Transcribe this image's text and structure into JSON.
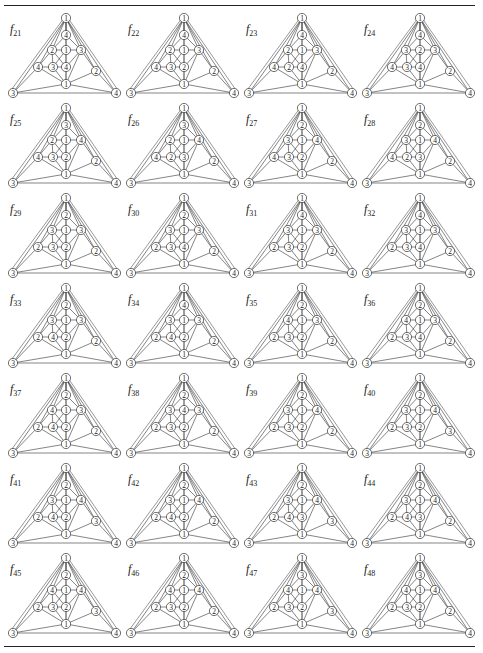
{
  "page": {
    "type": "figure page of vertex-labelled planar graphs (4-colourings)",
    "vertex_layout": [
      "top",
      "upper",
      "row1_left",
      "row1_center",
      "row1_right",
      "row2_left",
      "row2_inner",
      "row2_center",
      "right",
      "bottom",
      "corner_left",
      "corner_right"
    ]
  },
  "figures": [
    {
      "name": "f",
      "index": "21",
      "labels": [
        "1",
        "4",
        "2",
        "1",
        "3",
        "4",
        "3",
        "4",
        "2",
        "1",
        "3",
        "4"
      ]
    },
    {
      "name": "f",
      "index": "22",
      "labels": [
        "1",
        "4",
        "2",
        "1",
        "3",
        "4",
        "3",
        "2",
        "2",
        "1",
        "3",
        "4"
      ]
    },
    {
      "name": "f",
      "index": "23",
      "labels": [
        "1",
        "4",
        "2",
        "1",
        "3",
        "4",
        "2",
        "4",
        "2",
        "1",
        "3",
        "4"
      ]
    },
    {
      "name": "f",
      "index": "24",
      "labels": [
        "1",
        "4",
        "3",
        "2",
        "3",
        "4",
        "3",
        "4",
        "2",
        "1",
        "3",
        "4"
      ]
    },
    {
      "name": "f",
      "index": "25",
      "labels": [
        "1",
        "3",
        "2",
        "1",
        "4",
        "4",
        "3",
        "2",
        "2",
        "1",
        "3",
        "4"
      ]
    },
    {
      "name": "f",
      "index": "26",
      "labels": [
        "1",
        "3",
        "2",
        "1",
        "4",
        "4",
        "2",
        "3",
        "2",
        "1",
        "3",
        "4"
      ]
    },
    {
      "name": "f",
      "index": "27",
      "labels": [
        "1",
        "2",
        "3",
        "1",
        "4",
        "4",
        "3",
        "2",
        "2",
        "1",
        "3",
        "4"
      ]
    },
    {
      "name": "f",
      "index": "28",
      "labels": [
        "1",
        "2",
        "3",
        "1",
        "4",
        "4",
        "2",
        "3",
        "2",
        "1",
        "3",
        "4"
      ]
    },
    {
      "name": "f",
      "index": "29",
      "labels": [
        "1",
        "2",
        "3",
        "1",
        "3",
        "2",
        "3",
        "2",
        "2",
        "1",
        "3",
        "4"
      ]
    },
    {
      "name": "f",
      "index": "30",
      "labels": [
        "1",
        "2",
        "3",
        "1",
        "3",
        "2",
        "3",
        "4",
        "2",
        "1",
        "3",
        "4"
      ]
    },
    {
      "name": "f",
      "index": "31",
      "labels": [
        "1",
        "4",
        "3",
        "1",
        "3",
        "2",
        "3",
        "2",
        "2",
        "1",
        "3",
        "4"
      ]
    },
    {
      "name": "f",
      "index": "32",
      "labels": [
        "1",
        "4",
        "3",
        "1",
        "3",
        "2",
        "3",
        "4",
        "2",
        "1",
        "3",
        "4"
      ]
    },
    {
      "name": "f",
      "index": "33",
      "labels": [
        "1",
        "2",
        "3",
        "1",
        "3",
        "2",
        "4",
        "2",
        "2",
        "1",
        "3",
        "4"
      ]
    },
    {
      "name": "f",
      "index": "34",
      "labels": [
        "1",
        "4",
        "3",
        "1",
        "3",
        "2",
        "4",
        "2",
        "2",
        "1",
        "3",
        "4"
      ]
    },
    {
      "name": "f",
      "index": "35",
      "labels": [
        "1",
        "2",
        "4",
        "1",
        "3",
        "2",
        "3",
        "2",
        "2",
        "1",
        "3",
        "4"
      ]
    },
    {
      "name": "f",
      "index": "36",
      "labels": [
        "1",
        "2",
        "4",
        "1",
        "3",
        "2",
        "3",
        "4",
        "2",
        "1",
        "3",
        "4"
      ]
    },
    {
      "name": "f",
      "index": "37",
      "labels": [
        "1",
        "2",
        "4",
        "1",
        "3",
        "2",
        "4",
        "2",
        "2",
        "1",
        "3",
        "4"
      ]
    },
    {
      "name": "f",
      "index": "38",
      "labels": [
        "1",
        "2",
        "3",
        "4",
        "3",
        "2",
        "3",
        "2",
        "2",
        "1",
        "3",
        "4"
      ]
    },
    {
      "name": "f",
      "index": "39",
      "labels": [
        "1",
        "2",
        "3",
        "1",
        "4",
        "2",
        "3",
        "2",
        "2",
        "1",
        "3",
        "4"
      ]
    },
    {
      "name": "f",
      "index": "40",
      "labels": [
        "1",
        "2",
        "3",
        "1",
        "4",
        "2",
        "3",
        "2",
        "3",
        "1",
        "3",
        "4"
      ]
    },
    {
      "name": "f",
      "index": "41",
      "labels": [
        "1",
        "2",
        "3",
        "1",
        "4",
        "2",
        "4",
        "2",
        "3",
        "1",
        "3",
        "4"
      ]
    },
    {
      "name": "f",
      "index": "42",
      "labels": [
        "1",
        "2",
        "3",
        "1",
        "4",
        "2",
        "4",
        "2",
        "2",
        "1",
        "3",
        "4"
      ]
    },
    {
      "name": "f",
      "index": "43",
      "labels": [
        "1",
        "2",
        "3",
        "1",
        "4",
        "2",
        "4",
        "3",
        "3",
        "1",
        "3",
        "4"
      ]
    },
    {
      "name": "f",
      "index": "44",
      "labels": [
        "1",
        "2",
        "3",
        "1",
        "4",
        "2",
        "4",
        "3",
        "2",
        "1",
        "3",
        "4"
      ]
    },
    {
      "name": "f",
      "index": "45",
      "labels": [
        "1",
        "2",
        "4",
        "1",
        "4",
        "2",
        "3",
        "2",
        "3",
        "1",
        "3",
        "4"
      ]
    },
    {
      "name": "f",
      "index": "46",
      "labels": [
        "1",
        "2",
        "4",
        "1",
        "4",
        "2",
        "3",
        "2",
        "2",
        "1",
        "3",
        "4"
      ]
    },
    {
      "name": "f",
      "index": "47",
      "labels": [
        "1",
        "3",
        "4",
        "1",
        "4",
        "2",
        "3",
        "2",
        "3",
        "1",
        "3",
        "4"
      ]
    },
    {
      "name": "f",
      "index": "48",
      "labels": [
        "1",
        "3",
        "4",
        "1",
        "4",
        "2",
        "3",
        "2",
        "2",
        "1",
        "3",
        "4"
      ]
    }
  ],
  "style": {
    "line_color": "#333333",
    "node_fill": "#ffffff",
    "text_color": "#222222"
  }
}
